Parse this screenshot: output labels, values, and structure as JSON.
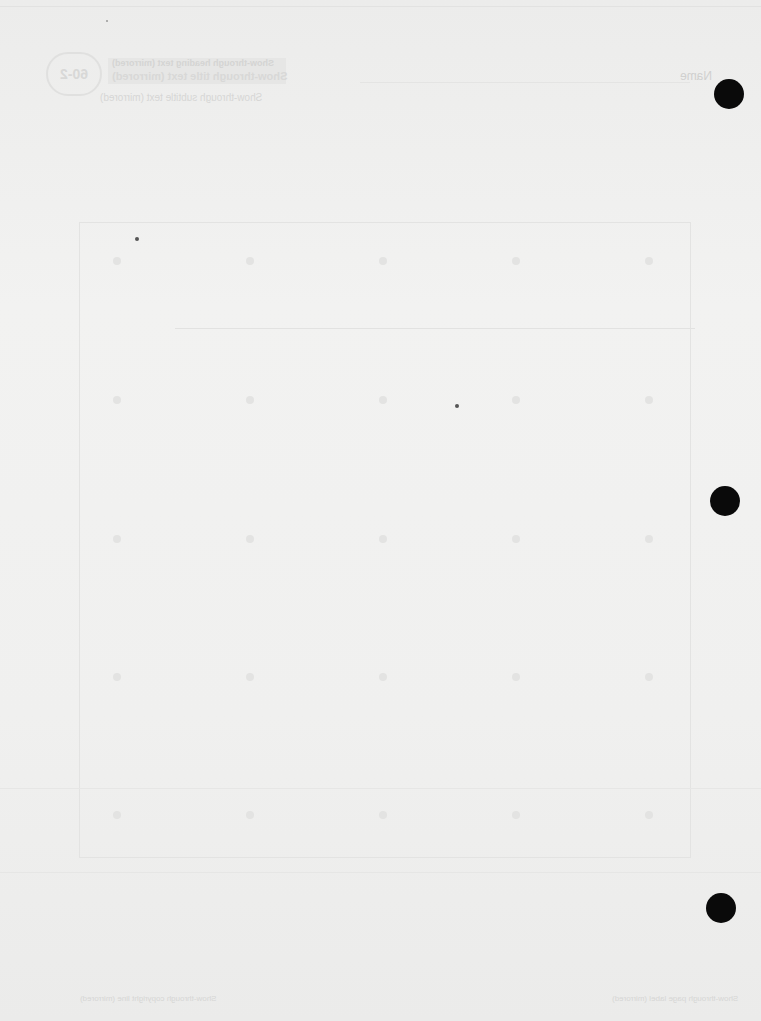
{
  "document": {
    "type": "blank worksheet page (reverse side, show-through scan)",
    "header": {
      "badge": "60-2",
      "title_line1": "Show-through heading text (mirrored)",
      "title_line2": "Show-through title text (mirrored)",
      "subtitle": "Show-through subtitle text (mirrored)",
      "name_label": "Name"
    },
    "grid": {
      "rows": 5,
      "columns": 5,
      "description": "faint dot grid inside rectangular frame"
    },
    "footer": {
      "left": "Show-through copyright line (mirrored)",
      "right": "Show-through page label (mirrored)"
    },
    "binder_holes": 3,
    "colors": {
      "paper": "#f0f0ef",
      "hole": "#0a0a0a",
      "faint_ink": "#d6d6d5"
    }
  }
}
